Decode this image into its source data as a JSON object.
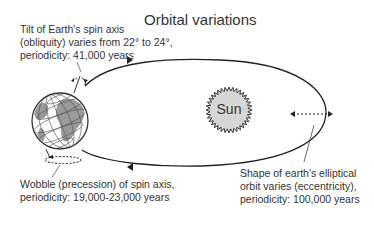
{
  "title": "Orbital variations",
  "sun_label": "Sun",
  "labels": {
    "obliquity": [
      "Tilt of Earth's spin axis",
      "(obliquity) varies from 22° to 24°,",
      "periodicity: 41,000 years"
    ],
    "precession": [
      "Wobble (precession) of spin axis,",
      "periodicity: 19,000-23,000 years"
    ],
    "eccentricity": [
      "Shape of earth's elliptical",
      "orbit varies (eccentricity),",
      "periodicity: 100,000 years"
    ]
  },
  "icons": {
    "earth": "globe-icon",
    "sun": "sun-icon"
  },
  "colors": {
    "line": "#222222",
    "sun_fill": "#d6d6d6",
    "land": "#9a9a9a",
    "text": "#333333"
  }
}
